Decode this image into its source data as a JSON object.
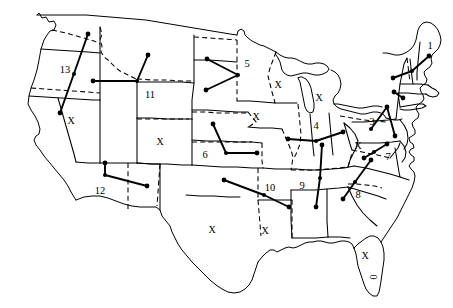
{
  "figure": {
    "width": 453,
    "height": 308,
    "background_color": "#ffffff",
    "line_color": "#000000"
  },
  "chart_data": {
    "type": "map",
    "grid": false,
    "legend": "none",
    "units": "pixels",
    "xlim": [
      0,
      453
    ],
    "ylim": [
      0,
      308
    ],
    "region_labels": [
      {
        "label": "1",
        "x": 430,
        "y": 47,
        "region": "Maine"
      },
      {
        "label": "3",
        "x": 372,
        "y": 123,
        "region": "Pennsylvania"
      },
      {
        "label": "4",
        "x": 316,
        "y": 127,
        "region": "Illinois-Indiana"
      },
      {
        "label": "5",
        "x": 247,
        "y": 65,
        "region": "Minnesota"
      },
      {
        "label": "6",
        "x": 205,
        "y": 156,
        "region": "Nebraska-Kansas"
      },
      {
        "label": "7",
        "x": 388,
        "y": 158,
        "region": "Virginia"
      },
      {
        "label": "8",
        "x": 358,
        "y": 196,
        "region": "South Carolina"
      },
      {
        "label": "9",
        "x": 302,
        "y": 187,
        "region": "Tennessee-Alabama"
      },
      {
        "label": "10",
        "x": 270,
        "y": 189,
        "region": "Oklahoma-Arkansas"
      },
      {
        "label": "11",
        "x": 150,
        "y": 96,
        "region": "Wyoming"
      },
      {
        "label": "12",
        "x": 100,
        "y": 192,
        "region": "Arizona-New Mexico"
      },
      {
        "label": "13",
        "x": 65,
        "y": 71,
        "region": "Washington-Oregon"
      }
    ],
    "x_markers": [
      {
        "label": "X",
        "x": 71,
        "y": 122,
        "rotated": false,
        "region": "Nevada"
      },
      {
        "label": "X",
        "x": 160,
        "y": 143,
        "rotated": false,
        "region": "Utah-Colorado"
      },
      {
        "label": "X",
        "x": 278,
        "y": 86,
        "rotated": false,
        "region": "Wisconsin"
      },
      {
        "label": "X",
        "x": 319,
        "y": 99,
        "rotated": false,
        "region": "Michigan"
      },
      {
        "label": "X",
        "x": 256,
        "y": 118,
        "rotated": false,
        "region": "Iowa"
      },
      {
        "label": "X",
        "x": 358,
        "y": 147,
        "rotated": false,
        "region": "West Virginia"
      },
      {
        "label": "X",
        "x": 212,
        "y": 231,
        "rotated": false,
        "region": "Texas"
      },
      {
        "label": "X",
        "x": 265,
        "y": 232,
        "rotated": false,
        "region": "Louisiana"
      },
      {
        "label": "X",
        "x": 365,
        "y": 257,
        "rotated": false,
        "region": "Florida"
      },
      {
        "label": "0",
        "x": 372,
        "y": 277,
        "rotated": true,
        "region": "Florida-peninsula"
      }
    ],
    "vectors": [
      {
        "id": "vector-13",
        "label": "13",
        "points": [
          [
            88,
            34
          ],
          [
            60,
            113
          ]
        ],
        "dots": [
          [
            88,
            34
          ],
          [
            60,
            113
          ]
        ],
        "midpoint_dot": [
          74,
          74
        ]
      },
      {
        "id": "vector-11",
        "label": "11",
        "points": [
          [
            93,
            81
          ],
          [
            137,
            81
          ],
          [
            148,
            55
          ]
        ],
        "dots": [
          [
            93,
            81
          ],
          [
            148,
            55
          ]
        ],
        "midpoint_dot": [
          137,
          81
        ]
      },
      {
        "id": "vector-5",
        "label": "5",
        "points": [
          [
            207,
            59
          ],
          [
            238,
            75
          ],
          [
            206,
            90
          ]
        ],
        "dots": [
          [
            207,
            59
          ],
          [
            206,
            90
          ]
        ],
        "midpoint_dot": [
          238,
          75
        ]
      },
      {
        "id": "vector-6",
        "label": "6",
        "points": [
          [
            213,
            124
          ],
          [
            226,
            153
          ],
          [
            257,
            153
          ]
        ],
        "dots": [
          [
            213,
            124
          ],
          [
            257,
            153
          ]
        ],
        "midpoint_dot": [
          226,
          153
        ]
      },
      {
        "id": "vector-12",
        "label": "12",
        "points": [
          [
            105,
            163
          ],
          [
            105,
            175
          ],
          [
            147,
            186
          ]
        ],
        "dots": [
          [
            105,
            163
          ],
          [
            147,
            186
          ]
        ],
        "midpoint_dot": [
          105,
          175
        ]
      },
      {
        "id": "vector-10",
        "label": "10",
        "points": [
          [
            224,
            180
          ],
          [
            264,
            195
          ],
          [
            289,
            207
          ]
        ],
        "dots": [
          [
            224,
            180
          ],
          [
            289,
            207
          ]
        ],
        "midpoint_dot": [
          264,
          195
        ]
      },
      {
        "id": "vector-4",
        "label": "4",
        "points": [
          [
            288,
            139
          ],
          [
            316,
            141
          ],
          [
            343,
            132
          ]
        ],
        "dots": [
          [
            288,
            139
          ],
          [
            343,
            132
          ]
        ],
        "midpoint_dot": [
          316,
          141
        ]
      },
      {
        "id": "vector-9",
        "label": "9",
        "points": [
          [
            322,
            145
          ],
          [
            320,
            178
          ],
          [
            316,
            207
          ]
        ],
        "dots": [
          [
            322,
            145
          ],
          [
            316,
            207
          ]
        ],
        "midpoint_dot": [
          320,
          178
        ]
      },
      {
        "id": "vector-8",
        "label": "8",
        "points": [
          [
            371,
            160
          ],
          [
            355,
            182
          ],
          [
            343,
            199
          ]
        ],
        "dots": [
          [
            371,
            160
          ],
          [
            343,
            199
          ]
        ],
        "midpoint_dot": [
          355,
          182
        ]
      },
      {
        "id": "vector-3",
        "label": "3",
        "points": [
          [
            371,
            129
          ],
          [
            387,
            107
          ],
          [
            395,
            136
          ]
        ],
        "dots": [
          [
            387,
            107
          ],
          [
            395,
            136
          ]
        ],
        "midpoint_dot": [
          371,
          129
        ]
      },
      {
        "id": "vector-1",
        "label": "1",
        "points": [
          [
            429,
            56
          ],
          [
            412,
            71
          ],
          [
            393,
            78
          ]
        ],
        "dots": [
          [
            429,
            56
          ],
          [
            393,
            78
          ]
        ],
        "midpoint_dot": [
          412,
          71
        ]
      },
      {
        "id": "vector-7",
        "label": "7",
        "points": [
          [
            387,
            144
          ],
          [
            374,
            152
          ],
          [
            364,
            158
          ]
        ],
        "dots": [
          [
            387,
            144
          ],
          [
            364,
            158
          ]
        ],
        "midpoint_dot": [
          374,
          152
        ]
      },
      {
        "id": "vector-2",
        "label": "2",
        "points": [
          [
            394,
            92
          ],
          [
            403,
            98
          ]
        ],
        "dots": [
          [
            394,
            92
          ],
          [
            403,
            98
          ]
        ],
        "midpoint_dot": null
      }
    ]
  }
}
